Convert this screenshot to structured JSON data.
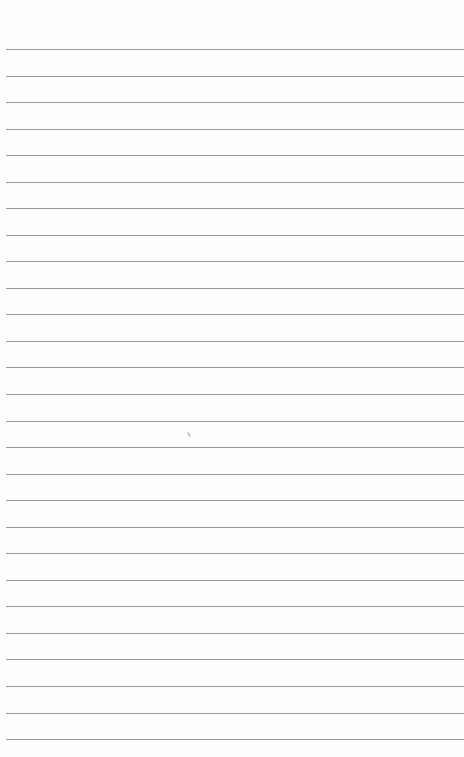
{
  "document": {
    "type": "lined-paper",
    "background_color": "#fefefe",
    "rule_color": "#9a9a9a",
    "rule_count": 27,
    "first_rule_y": 49,
    "rule_spacing": 26.54,
    "rule_left_x": 6,
    "text_content": []
  }
}
